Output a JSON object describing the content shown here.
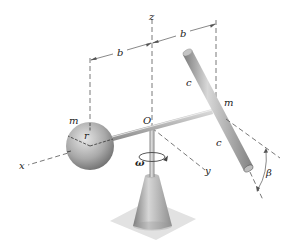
{
  "figure": {
    "labels": {
      "z_axis": "z",
      "x_axis": "x",
      "y_axis": "y",
      "origin": "O",
      "dim_left": "b",
      "dim_right": "b",
      "sphere_mass": "m",
      "sphere_radius": "r",
      "rod_mass": "m",
      "rod_upper_half": "c",
      "rod_lower_half": "c",
      "angular_velocity": "ω",
      "tilt_angle": "β"
    },
    "colors": {
      "background": "#ffffff",
      "metal_light": "#d9d9d9",
      "metal_mid": "#a8a8a8",
      "metal_dark": "#6e6e6e",
      "base_plate": "#e2e2e2",
      "dashed_line": "#555555",
      "text": "#222222"
    }
  }
}
